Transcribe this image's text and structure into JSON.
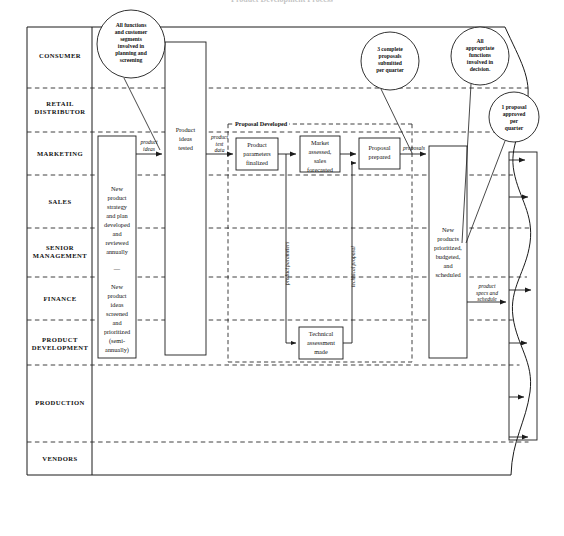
{
  "title": "Product Development Process",
  "lanes": [
    {
      "id": "consumer",
      "label": "CONSUMER"
    },
    {
      "id": "retail-distributor",
      "label": "RETAIL\nDISTRIBUTOR"
    },
    {
      "id": "marketing",
      "label": "MARKETING"
    },
    {
      "id": "sales",
      "label": "SALES"
    },
    {
      "id": "senior-management",
      "label": "SENIOR\nMANAGEMENT"
    },
    {
      "id": "finance",
      "label": "FINANCE"
    },
    {
      "id": "product-development",
      "label": "PRODUCT\nDEVELOPMENT"
    },
    {
      "id": "production",
      "label": "PRODUCTION"
    },
    {
      "id": "vendors",
      "label": "VENDORS"
    }
  ],
  "process_boxes": [
    {
      "id": "new-product-strategy",
      "text": "New\nproduct\nstrategy\nand plan\ndeveloped\nand\nreviewed\nannually\n\n—\n\nNew\nproduct\nideas\nscreened\nand\nprioritized\n(semi-\nannually)"
    },
    {
      "id": "product-ideas-tested",
      "text": "Product\nideas\ntested"
    },
    {
      "id": "product-parameters-finalized",
      "text": "Product\nparameters\nfinalized"
    },
    {
      "id": "market-assessed",
      "text": "Market\nassessed,\nsales\nforecasted"
    },
    {
      "id": "proposal-prepared",
      "text": "Proposal\nprepared"
    },
    {
      "id": "technical-assessment-made",
      "text": "Technical\nassessment\nmade"
    },
    {
      "id": "new-products-prioritized",
      "text": "New\nproducts\nprioritized,\nbudgeted,\nand\nscheduled"
    }
  ],
  "group_label": "Proposal Developed",
  "flow_labels": [
    {
      "id": "product-ideas",
      "text": "product\nideas"
    },
    {
      "id": "product-test-data",
      "text": "product\ntest\ndata"
    },
    {
      "id": "proposals",
      "text": "proposals"
    },
    {
      "id": "product-specs-and-schedule",
      "text": "product\nspecs and\nschedule"
    },
    {
      "id": "product-parameters",
      "text": "product parameters"
    },
    {
      "id": "technical-proposal",
      "text": "technical proposal"
    }
  ],
  "callouts": [
    {
      "id": "all-functions-planning",
      "text": "All functions\nand customer\nsegments\ninvolved in\nplanning and\nscreening"
    },
    {
      "id": "three-complete-proposals",
      "text": "3 complete\nproposals\nsubmitted\nper quarter"
    },
    {
      "id": "all-appropriate-functions",
      "text": "All\nappropriate\nfunctions\ninvolved in\ndecision."
    },
    {
      "id": "one-proposal-approved",
      "text": "1 proposal\napproved\nper\nquarter"
    }
  ],
  "colors": {
    "line": "#1b1b1b",
    "dashed": "#2b2b2b",
    "background": "#ffffff"
  }
}
